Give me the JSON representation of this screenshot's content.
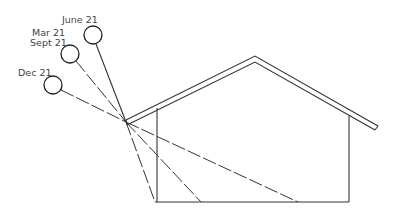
{
  "diagram": {
    "suns": [
      {
        "label": "June 21",
        "cx": 93,
        "cy": 35,
        "floor_x": 155
      },
      {
        "label": "Mar 21",
        "label2": "Sept 21",
        "cx": 70,
        "cy": 54,
        "floor_x": 201
      },
      {
        "label": "Dec 21",
        "cx": 53,
        "cy": 85,
        "floor_x": 298
      }
    ],
    "house": {
      "eave_point": [
        126,
        122
      ],
      "peak": [
        255,
        57
      ],
      "roof_right_end": [
        377,
        129
      ],
      "left_wall_x": 157,
      "right_wall_x": 349,
      "floor_y": 202
    },
    "colors": {
      "line": "#333333",
      "background": "#ffffff"
    }
  }
}
